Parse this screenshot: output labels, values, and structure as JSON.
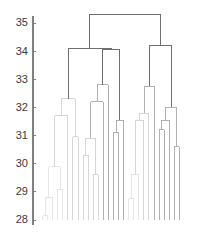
{
  "chart_data": {
    "type": "dendrogram",
    "title": "",
    "subtitle": "",
    "xlabel": "",
    "ylabel": "",
    "grid": false,
    "legend": null,
    "annotations": [],
    "x_axis": {
      "visible": false,
      "tick_labels": [],
      "n_leaves": 30,
      "leaf_order": [
        1,
        2,
        3,
        4,
        5,
        6,
        7,
        8,
        9,
        10,
        11,
        12,
        13,
        14,
        15,
        16,
        17,
        18,
        19,
        20,
        21,
        22,
        23,
        24,
        25,
        26,
        27,
        28,
        29,
        30
      ]
    },
    "y_axis": {
      "visible": true,
      "ylim": [
        28,
        35.6
      ],
      "tick_values": [
        28,
        29,
        30,
        31,
        32,
        33,
        34,
        35
      ],
      "tick_labels": [
        "28",
        "29",
        "30",
        "31",
        "32",
        "33",
        "34",
        "35"
      ],
      "baseline": 28
    },
    "colors": {
      "axis": "#808080",
      "tick_label": "#3a3a3a",
      "link_dark": "#6e6e6e",
      "link_mid": "#a8a8a8",
      "link_light": "#d2d2d2",
      "link_faint": "#e2e2e2",
      "background": "#ffffff"
    },
    "links": [
      {
        "id": "L1",
        "left": 1,
        "right": 2,
        "height": 28.15,
        "shade": "faint"
      },
      {
        "id": "L2",
        "left": "L1",
        "right": 3,
        "height": 28.8,
        "shade": "faint"
      },
      {
        "id": "L3",
        "left": 4,
        "right": 5,
        "height": 29.1,
        "shade": "faint"
      },
      {
        "id": "L4",
        "left": "L2",
        "right": "L3",
        "height": 29.9,
        "shade": "faint"
      },
      {
        "id": "L5",
        "left": "L4",
        "right": 6,
        "height": 31.7,
        "shade": "light"
      },
      {
        "id": "L6",
        "left": 7,
        "right": 8,
        "height": 30.95,
        "shade": "light"
      },
      {
        "id": "L7",
        "left": "L5",
        "right": "L6",
        "height": 32.3,
        "shade": "light"
      },
      {
        "id": "L8",
        "left": 9,
        "right": 10,
        "height": 30.3,
        "shade": "light"
      },
      {
        "id": "L9",
        "left": 11,
        "right": 12,
        "height": 29.6,
        "shade": "light"
      },
      {
        "id": "L10",
        "left": "L8",
        "right": "L9",
        "height": 30.9,
        "shade": "light"
      },
      {
        "id": "L11",
        "left": "L10",
        "right": 13,
        "height": 32.2,
        "shade": "mid"
      },
      {
        "id": "L12",
        "left": "L11",
        "right": 14,
        "height": 32.8,
        "shade": "mid"
      },
      {
        "id": "L13",
        "left": 15,
        "right": 16,
        "height": 31.1,
        "shade": "mid"
      },
      {
        "id": "L14",
        "left": "L13",
        "right": 17,
        "height": 31.55,
        "shade": "mid"
      },
      {
        "id": "L15",
        "left": "L12",
        "right": "L14",
        "height": 34.05,
        "shade": "dark"
      },
      {
        "id": "L16",
        "left": "L7",
        "right": "L15",
        "height": 34.1,
        "shade": "dark"
      },
      {
        "id": "L17",
        "left": 18,
        "right": 19,
        "height": 28.75,
        "shade": "faint"
      },
      {
        "id": "L18",
        "left": "L17",
        "right": 20,
        "height": 29.6,
        "shade": "faint"
      },
      {
        "id": "L19",
        "left": "L18",
        "right": 21,
        "height": 31.55,
        "shade": "light"
      },
      {
        "id": "L20",
        "left": "L19",
        "right": 22,
        "height": 31.8,
        "shade": "light"
      },
      {
        "id": "L21",
        "left": "L20",
        "right": 23,
        "height": 32.75,
        "shade": "mid"
      },
      {
        "id": "L22",
        "left": 24,
        "right": 25,
        "height": 31.2,
        "shade": "mid"
      },
      {
        "id": "L23",
        "left": "L22",
        "right": 26,
        "height": 31.55,
        "shade": "mid"
      },
      {
        "id": "L24",
        "left": 27,
        "right": 28,
        "height": 30.6,
        "shade": "mid"
      },
      {
        "id": "L25",
        "left": "L23",
        "right": "L24",
        "height": 32.0,
        "shade": "mid"
      },
      {
        "id": "L26",
        "left": "L21",
        "right": "L25",
        "height": 34.2,
        "shade": "dark"
      },
      {
        "id": "L27",
        "left": "L16",
        "right": "L26",
        "height": 35.3,
        "shade": "dark"
      }
    ],
    "extra_leaves": [
      {
        "leaf": 29,
        "note": "tail leaf bundled into rightmost group"
      },
      {
        "leaf": 30,
        "note": "tail leaf bundled into rightmost group"
      }
    ]
  }
}
